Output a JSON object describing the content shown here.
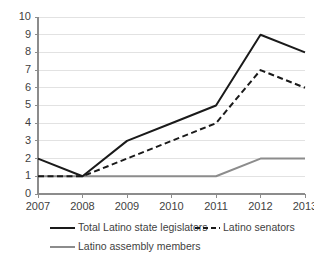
{
  "chart_data": {
    "type": "line",
    "title": "",
    "subtitle": "",
    "xlabel": "",
    "ylabel": "",
    "categories": [
      "2007",
      "2008",
      "2009",
      "2010",
      "2011",
      "2012",
      "2013"
    ],
    "x": [
      2007,
      2008,
      2009,
      2010,
      2011,
      2012,
      2013
    ],
    "ylim": [
      0,
      10
    ],
    "yticks": [
      0,
      1,
      2,
      3,
      4,
      5,
      6,
      7,
      8,
      9,
      10
    ],
    "ytick_labels": [
      "0",
      "1",
      "2",
      "3",
      "4",
      "5",
      "6",
      "7",
      "8",
      "9",
      "10"
    ],
    "grid": true,
    "grid_axis": "y",
    "legend_position": "bottom",
    "series": [
      {
        "name": "Total Latino state legislators",
        "values": [
          2,
          1,
          3,
          4,
          5,
          9,
          8
        ],
        "color": "#1a1a1a",
        "style": "solid"
      },
      {
        "name": "Latino senators",
        "values": [
          1,
          1,
          2,
          3,
          4,
          7,
          6
        ],
        "color": "#1a1a1a",
        "style": "dashed"
      },
      {
        "name": "Latino assembly members",
        "values": [
          1,
          1,
          1,
          1,
          1,
          2,
          2
        ],
        "color": "#8c8c8c",
        "style": "solid"
      }
    ]
  },
  "legend": {
    "entries": [
      {
        "label": "Total Latino state legislators"
      },
      {
        "label": "Latino senators"
      },
      {
        "label": "Latino assembly members"
      }
    ]
  },
  "colors": {
    "series_primary": "#1a1a1a",
    "series_secondary": "#8c8c8c",
    "gridline": "#e2e2e2",
    "axis": "#8c8c8c",
    "text": "#3f3f3f",
    "background": "#ffffff"
  }
}
